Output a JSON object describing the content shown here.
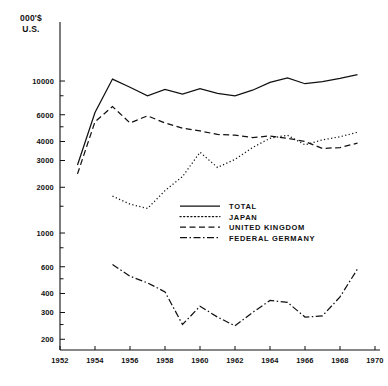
{
  "chart_data": {
    "type": "line",
    "title": "",
    "subtitle": "",
    "ylabel": "000'$ U.S.",
    "xlabel": "",
    "yscale": "log",
    "ylim": [
      170,
      16000
    ],
    "xlim": [
      1952,
      1970
    ],
    "grid": false,
    "legend_position": "center",
    "y_tick_labels": [
      "10000",
      "6000",
      "4000",
      "3000",
      "2000",
      "1000",
      "600",
      "400",
      "300",
      "200"
    ],
    "y_tick_values": [
      10000,
      6000,
      4000,
      3000,
      2000,
      1000,
      600,
      400,
      300,
      200
    ],
    "y_minor_ticks": [
      8000,
      5000,
      1500,
      800,
      500,
      250
    ],
    "x_tick_labels": [
      "1952",
      "1954",
      "1956",
      "1958",
      "1960",
      "1962",
      "1964",
      "1966",
      "1968",
      "1970"
    ],
    "x_tick_values": [
      1952,
      1954,
      1956,
      1958,
      1960,
      1962,
      1964,
      1966,
      1968,
      1970
    ],
    "x": [
      1953,
      1954,
      1955,
      1956,
      1957,
      1958,
      1959,
      1960,
      1961,
      1962,
      1963,
      1964,
      1965,
      1966,
      1967,
      1968,
      1969
    ],
    "series": [
      {
        "name": "TOTAL",
        "style": "solid",
        "values": [
          2800,
          6200,
          10300,
          9100,
          8000,
          8800,
          8200,
          8900,
          8300,
          8000,
          8700,
          9800,
          10500,
          9600,
          9900,
          10400,
          11000
        ]
      },
      {
        "name": "JAPAN",
        "style": "dotted",
        "values": [
          null,
          null,
          1750,
          1550,
          1450,
          1900,
          2350,
          3400,
          2700,
          3050,
          3650,
          4200,
          4400,
          3800,
          4100,
          4300,
          4600
        ]
      },
      {
        "name": "UNITED KINGDOM",
        "style": "dashed",
        "values": [
          2450,
          5400,
          6800,
          5300,
          5900,
          5300,
          4900,
          4700,
          4450,
          4400,
          4250,
          4350,
          4200,
          4000,
          3600,
          3650,
          3900
        ]
      },
      {
        "name": "FEDERAL GERMANY",
        "style": "dashdot",
        "values": [
          null,
          null,
          620,
          520,
          470,
          410,
          250,
          330,
          280,
          245,
          300,
          360,
          350,
          280,
          285,
          380,
          580
        ]
      }
    ],
    "legend_entries": [
      {
        "label": "TOTAL",
        "style": "solid"
      },
      {
        "label": "JAPAN",
        "style": "dotted"
      },
      {
        "label": "UNITED KINGDOM",
        "style": "dashed"
      },
      {
        "label": "FEDERAL GERMANY",
        "style": "dashdot"
      }
    ]
  }
}
